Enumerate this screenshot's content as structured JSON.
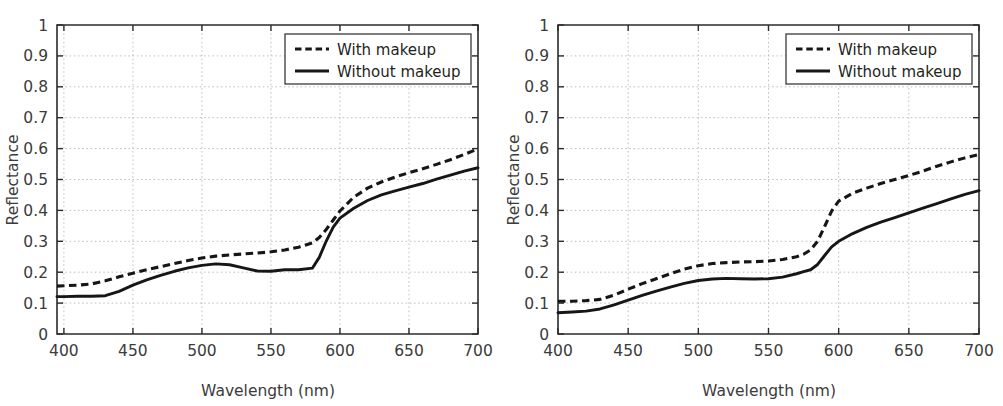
{
  "figure": {
    "panel_count": 2,
    "background_color": "#ffffff",
    "line_color": "#161616",
    "grid_color": "#b9b9b9",
    "axis_color": "#2b2b2b"
  },
  "chart_data": [
    {
      "type": "line",
      "panel": "left",
      "title": "",
      "xlabel": "Wavelength (nm)",
      "ylabel": "Reflectance",
      "xlim": [
        395,
        700
      ],
      "ylim": [
        0,
        1
      ],
      "xticks": [
        400,
        450,
        500,
        550,
        600,
        650,
        700
      ],
      "yticks": [
        0,
        0.1,
        0.2,
        0.3,
        0.4,
        0.5,
        0.6,
        0.7,
        0.8,
        0.9,
        1
      ],
      "xtick_labels": [
        "400",
        "450",
        "500",
        "550",
        "600",
        "650",
        "700"
      ],
      "ytick_labels": [
        "0",
        "0.1",
        "0.2",
        "0.3",
        "0.4",
        "0.5",
        "0.6",
        "0.7",
        "0.8",
        "0.9",
        "1"
      ],
      "grid": true,
      "legend_position": "top-right",
      "x": [
        395,
        400,
        410,
        420,
        430,
        440,
        450,
        460,
        470,
        480,
        490,
        500,
        510,
        520,
        530,
        540,
        550,
        560,
        570,
        580,
        585,
        590,
        595,
        600,
        610,
        620,
        630,
        640,
        650,
        660,
        670,
        680,
        690,
        700
      ],
      "series": [
        {
          "name": "With makeup",
          "style": "dashed",
          "values": [
            0.155,
            0.156,
            0.158,
            0.162,
            0.172,
            0.185,
            0.197,
            0.208,
            0.218,
            0.228,
            0.238,
            0.246,
            0.252,
            0.256,
            0.259,
            0.262,
            0.266,
            0.272,
            0.281,
            0.295,
            0.312,
            0.338,
            0.368,
            0.398,
            0.443,
            0.472,
            0.492,
            0.508,
            0.522,
            0.535,
            0.549,
            0.564,
            0.581,
            0.599
          ]
        },
        {
          "name": "Without makeup",
          "style": "solid",
          "values": [
            0.121,
            0.121,
            0.122,
            0.122,
            0.124,
            0.138,
            0.158,
            0.175,
            0.19,
            0.203,
            0.214,
            0.222,
            0.227,
            0.224,
            0.214,
            0.204,
            0.203,
            0.208,
            0.208,
            0.213,
            0.248,
            0.3,
            0.345,
            0.375,
            0.407,
            0.432,
            0.45,
            0.463,
            0.475,
            0.487,
            0.501,
            0.514,
            0.527,
            0.538
          ]
        }
      ],
      "legend": [
        {
          "label": "With makeup",
          "style": "dashed"
        },
        {
          "label": "Without makeup",
          "style": "solid"
        }
      ]
    },
    {
      "type": "line",
      "panel": "right",
      "title": "",
      "xlabel": "Wavelength (nm)",
      "ylabel": "Reflectance",
      "xlim": [
        400,
        700
      ],
      "ylim": [
        0,
        1
      ],
      "xticks": [
        400,
        450,
        500,
        550,
        600,
        650,
        700
      ],
      "yticks": [
        0,
        0.1,
        0.2,
        0.3,
        0.4,
        0.5,
        0.6,
        0.7,
        0.8,
        0.9,
        1
      ],
      "xtick_labels": [
        "400",
        "450",
        "500",
        "550",
        "600",
        "650",
        "700"
      ],
      "ytick_labels": [
        "0",
        "0.1",
        "0.2",
        "0.3",
        "0.4",
        "0.5",
        "0.6",
        "0.7",
        "0.8",
        "0.9",
        "1"
      ],
      "grid": true,
      "legend_position": "top-right",
      "x": [
        400,
        410,
        420,
        430,
        440,
        450,
        460,
        470,
        480,
        490,
        500,
        510,
        520,
        530,
        540,
        550,
        560,
        570,
        575,
        580,
        585,
        590,
        595,
        600,
        610,
        620,
        630,
        640,
        650,
        660,
        670,
        680,
        690,
        700
      ],
      "series": [
        {
          "name": "With makeup",
          "style": "dashed",
          "values": [
            0.106,
            0.106,
            0.108,
            0.112,
            0.126,
            0.145,
            0.163,
            0.179,
            0.195,
            0.21,
            0.221,
            0.228,
            0.231,
            0.233,
            0.234,
            0.236,
            0.241,
            0.25,
            0.258,
            0.272,
            0.3,
            0.348,
            0.398,
            0.43,
            0.456,
            0.472,
            0.487,
            0.5,
            0.513,
            0.527,
            0.543,
            0.557,
            0.57,
            0.581
          ]
        },
        {
          "name": "Without makeup",
          "style": "solid",
          "values": [
            0.069,
            0.071,
            0.074,
            0.081,
            0.094,
            0.11,
            0.125,
            0.139,
            0.152,
            0.164,
            0.173,
            0.178,
            0.18,
            0.179,
            0.178,
            0.179,
            0.184,
            0.195,
            0.202,
            0.208,
            0.225,
            0.254,
            0.282,
            0.3,
            0.325,
            0.345,
            0.362,
            0.377,
            0.392,
            0.407,
            0.422,
            0.437,
            0.452,
            0.464
          ]
        }
      ],
      "legend": [
        {
          "label": "With makeup",
          "style": "dashed"
        },
        {
          "label": "Without makeup",
          "style": "solid"
        }
      ]
    }
  ]
}
